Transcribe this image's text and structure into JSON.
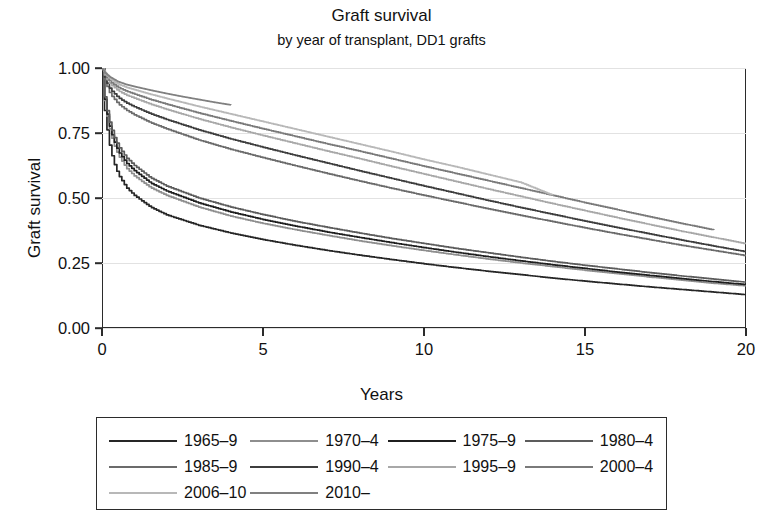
{
  "chart_data": {
    "type": "line",
    "title": "Graft survival",
    "subtitle": "by year of transplant, DD1 grafts",
    "xlabel": "Years",
    "ylabel": "Graft survival",
    "xlim": [
      0,
      20
    ],
    "ylim": [
      0,
      1.0
    ],
    "xticks": [
      0,
      5,
      10,
      15,
      20
    ],
    "xtick_labels": [
      "0",
      "5",
      "10",
      "15",
      "20"
    ],
    "yticks": [
      0.0,
      0.25,
      0.5,
      0.75,
      1.0
    ],
    "ytick_labels": [
      "0.00",
      "0.25",
      "0.50",
      "0.75",
      "1.00"
    ],
    "grid": "horizontal",
    "legend_position": "below-plot",
    "legend_columns": 4,
    "series": [
      {
        "name": "1965-9",
        "label": "1965–9",
        "color": "#262626",
        "width": 1.7,
        "x": [
          0,
          0.08,
          0.2,
          0.35,
          0.5,
          0.75,
          1,
          1.5,
          2,
          3,
          4,
          5,
          6,
          7,
          8,
          9,
          10,
          11,
          12,
          13,
          14,
          15,
          16,
          17,
          18,
          19,
          20
        ],
        "y": [
          1.0,
          0.83,
          0.72,
          0.64,
          0.59,
          0.54,
          0.51,
          0.465,
          0.435,
          0.395,
          0.365,
          0.34,
          0.318,
          0.298,
          0.28,
          0.263,
          0.247,
          0.232,
          0.218,
          0.205,
          0.192,
          0.18,
          0.169,
          0.158,
          0.148,
          0.138,
          0.128
        ]
      },
      {
        "name": "1970-4",
        "label": "1970–4",
        "color": "#8e8e8e",
        "width": 1.7,
        "x": [
          0,
          0.08,
          0.2,
          0.35,
          0.5,
          0.75,
          1,
          1.5,
          2,
          3,
          4,
          5,
          6,
          7,
          8,
          9,
          10,
          11,
          12,
          13,
          14,
          15,
          16,
          17,
          18,
          19,
          20
        ],
        "y": [
          1.0,
          0.87,
          0.78,
          0.71,
          0.665,
          0.615,
          0.585,
          0.54,
          0.51,
          0.465,
          0.43,
          0.402,
          0.378,
          0.356,
          0.335,
          0.316,
          0.298,
          0.281,
          0.265,
          0.25,
          0.236,
          0.222,
          0.209,
          0.196,
          0.184,
          0.172,
          0.162
        ]
      },
      {
        "name": "1975-9",
        "label": "1975–9",
        "color": "#1f1f1f",
        "width": 1.7,
        "x": [
          0,
          0.08,
          0.2,
          0.35,
          0.5,
          0.75,
          1,
          1.5,
          2,
          3,
          4,
          5,
          6,
          7,
          8,
          9,
          10,
          11,
          12,
          13,
          14,
          15,
          16,
          17,
          18,
          19,
          20
        ],
        "y": [
          1.0,
          0.875,
          0.79,
          0.725,
          0.68,
          0.635,
          0.605,
          0.558,
          0.527,
          0.481,
          0.446,
          0.417,
          0.392,
          0.369,
          0.348,
          0.328,
          0.309,
          0.291,
          0.274,
          0.258,
          0.243,
          0.229,
          0.215,
          0.202,
          0.19,
          0.178,
          0.167
        ]
      },
      {
        "name": "1980-4",
        "label": "1980–4",
        "color": "#5c5c5c",
        "width": 1.7,
        "x": [
          0,
          0.08,
          0.2,
          0.35,
          0.5,
          0.75,
          1,
          1.5,
          2,
          3,
          4,
          5,
          6,
          7,
          8,
          9,
          10,
          11,
          12,
          13,
          14,
          15,
          16,
          17,
          18,
          19,
          20
        ],
        "y": [
          1.0,
          0.885,
          0.805,
          0.742,
          0.7,
          0.655,
          0.625,
          0.578,
          0.546,
          0.5,
          0.465,
          0.436,
          0.41,
          0.387,
          0.365,
          0.344,
          0.325,
          0.306,
          0.289,
          0.272,
          0.256,
          0.241,
          0.227,
          0.213,
          0.2,
          0.188,
          0.176
        ]
      },
      {
        "name": "1985-9",
        "label": "1985–9",
        "color": "#6b6b6b",
        "width": 1.7,
        "x": [
          0,
          0.1,
          0.25,
          0.5,
          0.75,
          1,
          1.5,
          2,
          3,
          4,
          5,
          6,
          7,
          8,
          9,
          10,
          11,
          12,
          13,
          14,
          15,
          16,
          17,
          18,
          19,
          20
        ],
        "y": [
          1.0,
          0.945,
          0.9,
          0.862,
          0.838,
          0.82,
          0.79,
          0.766,
          0.723,
          0.687,
          0.655,
          0.624,
          0.594,
          0.565,
          0.537,
          0.51,
          0.484,
          0.458,
          0.433,
          0.409,
          0.385,
          0.362,
          0.34,
          0.318,
          0.298,
          0.278
        ]
      },
      {
        "name": "1990-4",
        "label": "1990–4",
        "color": "#3d3d3d",
        "width": 1.7,
        "x": [
          0,
          0.1,
          0.25,
          0.5,
          0.75,
          1,
          1.5,
          2,
          3,
          4,
          5,
          6,
          7,
          8,
          9,
          10,
          11,
          12,
          13,
          14,
          15,
          16,
          17,
          18,
          19,
          20
        ],
        "y": [
          1.0,
          0.955,
          0.918,
          0.886,
          0.866,
          0.851,
          0.824,
          0.802,
          0.762,
          0.727,
          0.695,
          0.664,
          0.634,
          0.604,
          0.575,
          0.546,
          0.518,
          0.49,
          0.463,
          0.437,
          0.411,
          0.386,
          0.362,
          0.338,
          0.315,
          0.293
        ]
      },
      {
        "name": "1995-9",
        "label": "1995–9",
        "color": "#a8a8a8",
        "width": 1.7,
        "x": [
          0,
          0.1,
          0.25,
          0.5,
          0.75,
          1,
          1.5,
          2,
          3,
          4,
          5,
          6,
          7,
          8,
          9,
          10,
          11,
          12,
          13,
          14,
          15,
          16,
          17,
          18,
          19,
          20
        ],
        "y": [
          1.0,
          0.965,
          0.938,
          0.912,
          0.896,
          0.884,
          0.861,
          0.841,
          0.804,
          0.771,
          0.74,
          0.71,
          0.68,
          0.651,
          0.621,
          0.592,
          0.563,
          0.534,
          0.506,
          0.478,
          0.451,
          0.424,
          0.398,
          0.372,
          0.348,
          0.324
        ]
      },
      {
        "name": "2000-4",
        "label": "2000–4",
        "color": "#7a7a7a",
        "width": 1.7,
        "x": [
          0,
          0.1,
          0.25,
          0.5,
          0.75,
          1,
          1.5,
          2,
          3,
          4,
          5,
          6,
          7,
          8,
          9,
          10,
          11,
          12,
          13,
          14,
          15,
          16,
          17,
          18,
          19
        ],
        "y": [
          1.0,
          0.972,
          0.948,
          0.925,
          0.911,
          0.9,
          0.879,
          0.861,
          0.827,
          0.796,
          0.766,
          0.737,
          0.708,
          0.68,
          0.651,
          0.622,
          0.594,
          0.566,
          0.538,
          0.51,
          0.482,
          0.455,
          0.428,
          0.402,
          0.377
        ]
      },
      {
        "name": "2006-10",
        "label": "2006–10",
        "color": "#b8b8b8",
        "width": 1.7,
        "x": [
          0,
          0.1,
          0.25,
          0.5,
          0.75,
          1,
          1.5,
          2,
          3,
          4,
          5,
          6,
          7,
          8,
          9,
          10,
          11,
          12,
          13,
          14
        ],
        "y": [
          1.0,
          0.978,
          0.958,
          0.938,
          0.926,
          0.917,
          0.899,
          0.883,
          0.852,
          0.823,
          0.794,
          0.765,
          0.736,
          0.707,
          0.678,
          0.648,
          0.62,
          0.59,
          0.56,
          0.51
        ]
      },
      {
        "name": "2010-",
        "label": "2010–",
        "color": "#808080",
        "width": 1.7,
        "x": [
          0,
          0.1,
          0.25,
          0.5,
          0.75,
          1,
          1.5,
          2,
          2.5,
          3,
          3.5,
          4
        ],
        "y": [
          1.0,
          0.982,
          0.966,
          0.948,
          0.937,
          0.929,
          0.915,
          0.902,
          0.89,
          0.879,
          0.868,
          0.858
        ]
      }
    ]
  },
  "colors": {
    "axis": "#2b2b2b",
    "grid": "#e2e2e2",
    "text": "#111111",
    "background": "#ffffff"
  }
}
